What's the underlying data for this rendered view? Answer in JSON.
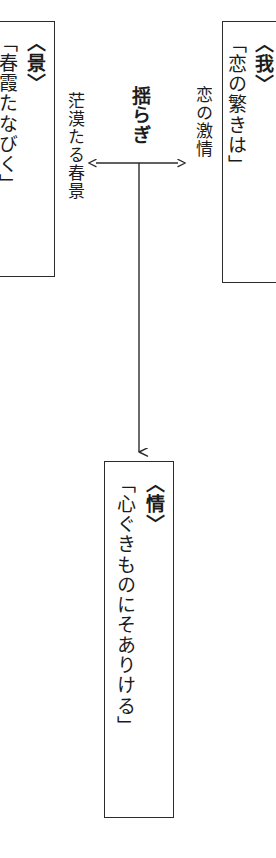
{
  "diagram": {
    "title_note": "",
    "nodes": {
      "kei": {
        "tag": "〈景〉",
        "quote": "「春霞たなびく」"
      },
      "ware": {
        "tag": "〈我〉",
        "quote": "「恋の繁きは」"
      },
      "jou": {
        "tag": "〈情〉",
        "quote": "「心ぐきものにそありける」"
      }
    },
    "annotations": {
      "center": "揺らぎ",
      "left": "茫漠たる春景",
      "right": "恋の激情"
    },
    "connectors": {
      "horizontal_arrow": "double-headed-horizontal-arrow",
      "vertical_arrow": "down-arrow"
    },
    "colors": {
      "ink": "#1c1c1c",
      "line": "#2b2b2b",
      "background": "#ffffff"
    }
  }
}
